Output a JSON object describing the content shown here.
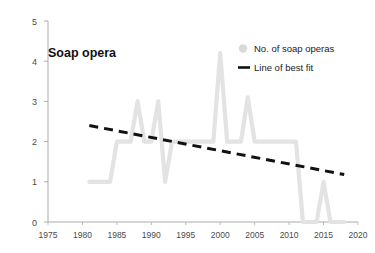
{
  "chart_data": {
    "type": "line",
    "title": "Soap opera",
    "xlabel": "",
    "ylabel": "",
    "xlim": [
      1975,
      2020
    ],
    "ylim": [
      0,
      5
    ],
    "grid": false,
    "legend_position": "top-right",
    "x_ticks": [
      "1975",
      "1980",
      "1985",
      "1990",
      "1995",
      "2000",
      "2005",
      "2010",
      "2015",
      "2020"
    ],
    "y_ticks": [
      "0",
      "1",
      "2",
      "3",
      "4",
      "5"
    ],
    "x_tick_values": [
      1975,
      1980,
      1985,
      1990,
      1995,
      2000,
      2005,
      2010,
      2015,
      2020
    ],
    "y_tick_values": [
      0,
      1,
      2,
      3,
      4,
      5
    ],
    "series": [
      {
        "name": "No. of soap operas",
        "type": "line",
        "color": "#e3e3e3",
        "marker": "dot",
        "x": [
          1981,
          1982,
          1983,
          1984,
          1985,
          1986,
          1987,
          1988,
          1989,
          1990,
          1991,
          1992,
          1993,
          1994,
          1995,
          1996,
          1997,
          1998,
          1999,
          2000,
          2001,
          2002,
          2003,
          2004,
          2005,
          2006,
          2007,
          2008,
          2009,
          2010,
          2011,
          2012,
          2013,
          2014,
          2015,
          2016,
          2017,
          2018
        ],
        "values": [
          1,
          1,
          1,
          1,
          2,
          2,
          2,
          3,
          2,
          2,
          3,
          1,
          2,
          2,
          2,
          2,
          2,
          2,
          2,
          4.2,
          2,
          2,
          2,
          3.1,
          2,
          2,
          2,
          2,
          2,
          2,
          2,
          0,
          0,
          0,
          1,
          0,
          0,
          0
        ]
      },
      {
        "name": "Line of best fit",
        "type": "trend",
        "color": "#111111",
        "style": "dashed",
        "x": [
          1981,
          2018
        ],
        "values": [
          2.4,
          1.18
        ]
      }
    ],
    "legend": [
      {
        "label": "No. of soap operas",
        "marker": "dot",
        "color": "#d9d9d9"
      },
      {
        "label": "Line of best fit",
        "marker": "dash",
        "color": "#111111"
      }
    ]
  },
  "axes": {
    "axis_color": "#aaaaaa"
  }
}
